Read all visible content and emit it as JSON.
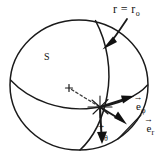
{
  "figure": {
    "kind": "spherical-coordinates-diagram",
    "background_color": "#ffffff",
    "ink_color": "#111111",
    "width": 165,
    "height": 162
  },
  "labels": {
    "radius_label": {
      "text": "r = r",
      "subscript": "o",
      "full": "r = r_o",
      "name": "radius-condition-label"
    },
    "surface_label": {
      "text": "S",
      "name": "surface-label"
    },
    "unit_vector_phi": {
      "base": "e",
      "subscript": "φ",
      "accent": "→",
      "full": "ê_φ",
      "name": "unit-vector-phi-label"
    },
    "unit_vector_r": {
      "base": "e",
      "subscript": "r",
      "accent": "→",
      "full": "ê_r",
      "name": "unit-vector-r-label"
    },
    "unit_vector_theta": {
      "base": "e",
      "subscript": "θ",
      "accent": "→",
      "full": "ê_θ",
      "name": "unit-vector-theta-label"
    }
  },
  "geometry": {
    "sphere": {
      "center_x": 79,
      "center_y": 85,
      "radius_x": 69,
      "radius_y": 66
    },
    "sphere_center_marker": {
      "x": 69,
      "y": 88
    },
    "surface_point": {
      "x": 100,
      "y": 107
    },
    "vectors": [
      {
        "name": "e-phi",
        "from": [
          100,
          107
        ],
        "to": [
          133,
          97
        ],
        "label": "e_phi"
      },
      {
        "name": "e-r",
        "from": [
          100,
          107
        ],
        "to": [
          126,
          125
        ],
        "label": "e_r"
      },
      {
        "name": "e-theta",
        "from": [
          100,
          107
        ],
        "to": [
          102,
          143
        ],
        "label": "e_theta"
      }
    ],
    "callout_arrow": {
      "name": "r-equals-r0-callout",
      "start": [
        126,
        20
      ],
      "end": [
        105,
        47
      ]
    }
  }
}
